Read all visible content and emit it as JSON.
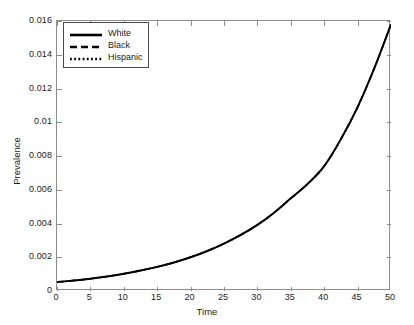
{
  "chart_data": {
    "type": "line",
    "title": "",
    "xlabel": "Time",
    "ylabel": "Prevalence",
    "xlim": [
      0,
      50
    ],
    "ylim": [
      0,
      0.016
    ],
    "grid": false,
    "legend_position": "top-left",
    "xticks": [
      "0",
      "5",
      "10",
      "15",
      "20",
      "25",
      "30",
      "35",
      "40",
      "45",
      "50"
    ],
    "yticks": [
      "0",
      "0.002",
      "0.004",
      "0.006",
      "0.008",
      "0.01",
      "0.012",
      "0.014",
      "0.016"
    ],
    "x": [
      0,
      2.5,
      5,
      7.5,
      10,
      12.5,
      15,
      17.5,
      20,
      22.5,
      25,
      27.5,
      30,
      32.5,
      35,
      37.5,
      40,
      42.5,
      45,
      47.5,
      50
    ],
    "series": [
      {
        "name": "White",
        "linestyle": "solid",
        "color": "#000000",
        "values": [
          0.00053,
          0.00062,
          0.00073,
          0.00086,
          0.00102,
          0.00121,
          0.00143,
          0.00169,
          0.002,
          0.00237,
          0.00281,
          0.00332,
          0.00392,
          0.00464,
          0.00549,
          0.00634,
          0.0074,
          0.009,
          0.0109,
          0.0132,
          0.0158
        ]
      },
      {
        "name": "Black",
        "linestyle": "dashed",
        "color": "#000000",
        "values": [
          0.00053,
          0.00062,
          0.00073,
          0.00086,
          0.00102,
          0.00121,
          0.00143,
          0.00169,
          0.002,
          0.00237,
          0.00281,
          0.00332,
          0.00392,
          0.00464,
          0.00549,
          0.00634,
          0.0074,
          0.009,
          0.0109,
          0.0132,
          0.0158
        ]
      },
      {
        "name": "Hispanic",
        "linestyle": "dotted",
        "color": "#000000",
        "values": [
          0.00053,
          0.00062,
          0.00073,
          0.00086,
          0.00102,
          0.00121,
          0.00143,
          0.00169,
          0.002,
          0.00237,
          0.00281,
          0.00332,
          0.00392,
          0.00464,
          0.00549,
          0.00634,
          0.0074,
          0.009,
          0.0109,
          0.0132,
          0.0158
        ]
      }
    ],
    "axis_color": "#8d8d8d",
    "text_color": "#1a1a1a",
    "background": "#ffffff"
  },
  "legend": {
    "entries": [
      {
        "label": "White",
        "style": "solid"
      },
      {
        "label": "Black",
        "style": "dashed"
      },
      {
        "label": "Hispanic",
        "style": "dotted"
      }
    ]
  }
}
